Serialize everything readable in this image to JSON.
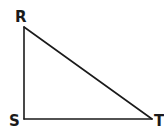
{
  "diagram": {
    "type": "right-triangle",
    "stroke_color": "#1a1a1a",
    "background": "#ffffff",
    "vertices": [
      {
        "name": "R",
        "label": "R",
        "x": 24,
        "y": 27,
        "label_x": 15,
        "label_y": 22
      },
      {
        "name": "S",
        "label": "S",
        "x": 24,
        "y": 119,
        "label_x": 9,
        "label_y": 126
      },
      {
        "name": "T",
        "label": "T",
        "x": 152,
        "y": 119,
        "label_x": 154,
        "label_y": 126
      }
    ],
    "sides": [
      {
        "name": "RS",
        "from": "R",
        "to": "S"
      },
      {
        "name": "ST",
        "from": "S",
        "to": "T"
      },
      {
        "name": "RT",
        "from": "R",
        "to": "T"
      }
    ],
    "right_angle_at": "S"
  }
}
